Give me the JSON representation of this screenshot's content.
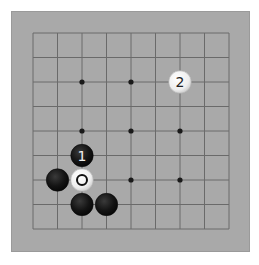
{
  "board": {
    "size": 9,
    "grid_origin_x": 33,
    "grid_origin_y": 33,
    "spacing": 24.5,
    "colors": {
      "board": "#a9a9a9",
      "line": "#6a6a6a",
      "star": "#1a1a1a",
      "black_stone": "#141414",
      "white_stone": "#f4f4f4"
    },
    "star_points": [
      {
        "col": 2,
        "row": 2
      },
      {
        "col": 4,
        "row": 2
      },
      {
        "col": 2,
        "row": 4
      },
      {
        "col": 4,
        "row": 4
      },
      {
        "col": 6,
        "row": 4
      },
      {
        "col": 4,
        "row": 6
      },
      {
        "col": 6,
        "row": 6
      }
    ],
    "stones": [
      {
        "color": "black",
        "col": 2,
        "row": 5,
        "label": "1"
      },
      {
        "color": "white",
        "col": 6,
        "row": 2,
        "label": "2"
      },
      {
        "color": "white",
        "col": 2,
        "row": 6,
        "label": "",
        "marker": "circle"
      },
      {
        "color": "black",
        "col": 1,
        "row": 6,
        "label": ""
      },
      {
        "color": "black",
        "col": 2,
        "row": 7,
        "label": ""
      },
      {
        "color": "black",
        "col": 3,
        "row": 7,
        "label": ""
      }
    ]
  }
}
